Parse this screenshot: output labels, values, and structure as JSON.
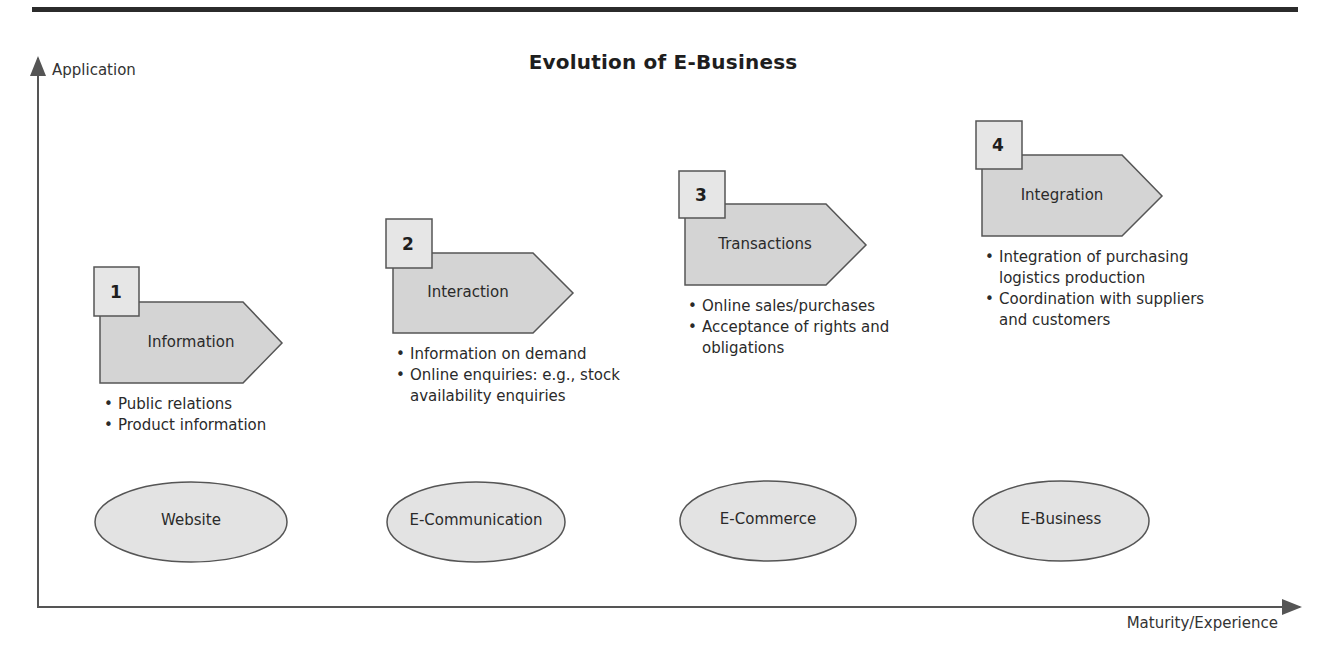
{
  "title": "Evolution of E-Business",
  "axes": {
    "y_label": "Application",
    "x_label": "Maturity/Experience"
  },
  "colors": {
    "rule": "#2b2b2b",
    "shape_fill": "#d4d4d4",
    "number_box_fill": "#e6e6e6",
    "ellipse_fill": "#e3e3e3",
    "stroke": "#555555",
    "axis": "#555555"
  },
  "stages": [
    {
      "number": "1",
      "label": "Information",
      "bullets": [
        "Public relations",
        "Product information"
      ],
      "category": "Website"
    },
    {
      "number": "2",
      "label": "Interaction",
      "bullets": [
        "Information on demand",
        "Online enquiries: e.g., stock availability enquiries"
      ],
      "category": "E-Communication"
    },
    {
      "number": "3",
      "label": "Transactions",
      "bullets": [
        "Online sales/purchases",
        "Acceptance of rights and obligations"
      ],
      "category": "E-Commerce"
    },
    {
      "number": "4",
      "label": "Integration",
      "bullets": [
        "Integration of purchasing logistics production",
        "Coordination with suppliers and customers"
      ],
      "category": "E-Business"
    }
  ]
}
